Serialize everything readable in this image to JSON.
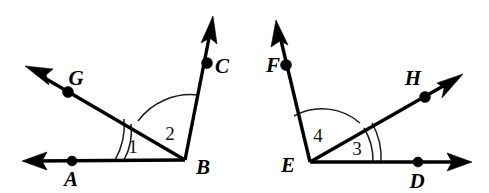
{
  "figure": {
    "background_color": "#ffffff",
    "line_color": "#000000",
    "arc_color": "#1a1a1a",
    "width": 489,
    "height": 193
  },
  "left_figure": {
    "name": "angle-figure-B",
    "vertex": {
      "label": "B",
      "x": 185,
      "y": 160,
      "label_x": 196,
      "label_y": 174
    },
    "rays": [
      {
        "name": "ray-BA",
        "from_x": 185,
        "from_y": 160,
        "to_x": 32,
        "to_y": 161,
        "arrow_tip_x": 22,
        "arrow_tip_y": 161,
        "point": {
          "label": "A",
          "x": 72,
          "y": 161,
          "label_x": 71,
          "label_y": 186
        }
      },
      {
        "name": "ray-BG",
        "from_x": 185,
        "from_y": 160,
        "to_x": 36,
        "to_y": 73,
        "arrow_tip_x": 25,
        "arrow_tip_y": 66,
        "point": {
          "label": "G",
          "x": 68,
          "y": 92,
          "label_x": 76,
          "label_y": 85
        }
      },
      {
        "name": "ray-BC",
        "from_x": 185,
        "from_y": 160,
        "to_x": 211,
        "to_y": 28,
        "arrow_tip_x": 213,
        "arrow_tip_y": 16,
        "point": {
          "label": "C",
          "x": 207,
          "y": 63,
          "label_x": 215,
          "label_y": 73
        }
      }
    ],
    "angles": [
      {
        "name": "angle-1",
        "label": "1",
        "label_x": 133,
        "label_y": 153,
        "arc_count": 2,
        "between": "BA and BG"
      },
      {
        "name": "angle-2",
        "label": "2",
        "label_x": 170,
        "label_y": 140,
        "arc_count": 1,
        "between": "BG and BC"
      }
    ]
  },
  "right_figure": {
    "name": "angle-figure-E",
    "vertex": {
      "label": "E",
      "x": 310,
      "y": 162,
      "label_x": 288,
      "label_y": 172
    },
    "rays": [
      {
        "name": "ray-ED",
        "from_x": 310,
        "from_y": 162,
        "to_x": 460,
        "to_y": 162,
        "arrow_tip_x": 472,
        "arrow_tip_y": 162,
        "point": {
          "label": "D",
          "x": 418,
          "y": 162,
          "label_x": 417,
          "label_y": 188
        }
      },
      {
        "name": "ray-EF",
        "from_x": 310,
        "from_y": 162,
        "to_x": 279,
        "to_y": 32,
        "arrow_tip_x": 276,
        "arrow_tip_y": 20,
        "point": {
          "label": "F",
          "x": 286,
          "y": 65,
          "label_x": 266,
          "label_y": 72
        }
      },
      {
        "name": "ray-EH",
        "from_x": 310,
        "from_y": 162,
        "to_x": 452,
        "to_y": 81,
        "arrow_tip_x": 463,
        "arrow_tip_y": 74,
        "point": {
          "label": "H",
          "x": 425,
          "y": 97,
          "label_x": 413,
          "label_y": 85
        }
      }
    ],
    "angles": [
      {
        "name": "angle-4",
        "label": "4",
        "label_x": 318,
        "label_y": 142,
        "arc_count": 1,
        "between": "EF and EH"
      },
      {
        "name": "angle-3",
        "label": "3",
        "label_x": 357,
        "label_y": 155,
        "arc_count": 2,
        "between": "EH and ED"
      }
    ]
  }
}
